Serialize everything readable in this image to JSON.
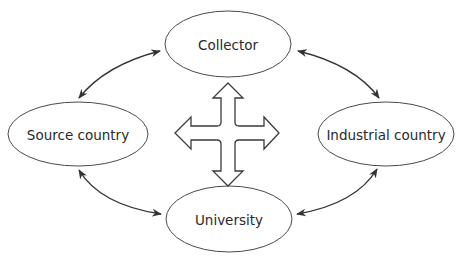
{
  "diagram": {
    "type": "cycle-relationship",
    "nodes": [
      {
        "id": "collector",
        "label": "Collector",
        "cx": 228,
        "cy": 44,
        "rx": 63,
        "ry": 33
      },
      {
        "id": "source",
        "label": "Source country",
        "cx": 78,
        "cy": 134,
        "rx": 70,
        "ry": 32
      },
      {
        "id": "industrial",
        "label": "Industrial country",
        "cx": 386,
        "cy": 134,
        "rx": 68,
        "ry": 32
      },
      {
        "id": "university",
        "label": "University",
        "cx": 229,
        "cy": 219,
        "rx": 63,
        "ry": 33
      }
    ],
    "edges": [
      {
        "from": "collector",
        "to": "source",
        "type": "bidirectional"
      },
      {
        "from": "collector",
        "to": "industrial",
        "type": "bidirectional"
      },
      {
        "from": "source",
        "to": "university",
        "type": "bidirectional"
      },
      {
        "from": "industrial",
        "to": "university",
        "type": "bidirectional"
      }
    ],
    "center_symbol": "four-way-arrow-icon",
    "colors": {
      "stroke": "#4a4a4a",
      "arrow": "#333333",
      "text": "#2a2a2a",
      "fill": "#ffffff"
    }
  }
}
